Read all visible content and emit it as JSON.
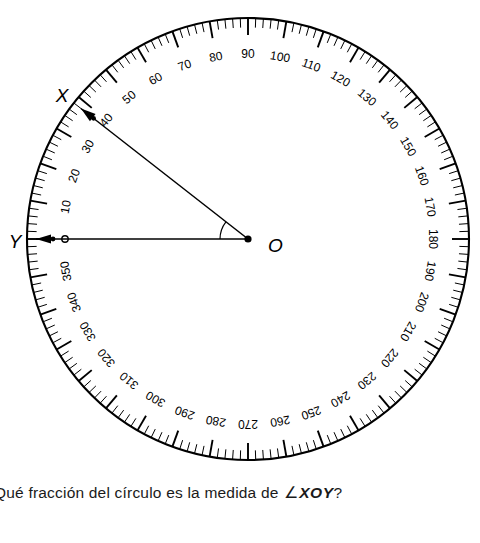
{
  "diagram": {
    "type": "full-circle-protractor",
    "center_label": "O",
    "point_labels": [
      "X",
      "Y"
    ],
    "geometry": {
      "center_x": 248,
      "center_y": 239,
      "radius": 221,
      "tick_step_degrees": 2,
      "label_step_degrees": 10,
      "zero_direction": "left",
      "direction": "clockwise",
      "ray_OY_degrees": 0,
      "ray_OX_degrees": 38,
      "angle_arc_radius": 28
    },
    "scale_labels": [
      "10",
      "20",
      "30",
      "40",
      "50",
      "60",
      "70",
      "80",
      "90",
      "100",
      "110",
      "120",
      "130",
      "140",
      "150",
      "160",
      "170",
      "180",
      "190",
      "200",
      "210",
      "220",
      "230",
      "240",
      "250",
      "260",
      "270",
      "280",
      "290",
      "300",
      "310",
      "320",
      "330",
      "340",
      "350"
    ],
    "colors": {
      "ink": "#000000",
      "background": "#ffffff",
      "text": "#1a1a1a"
    }
  },
  "question": {
    "prefix": "Qué fracción del círculo es la medida de ",
    "angle_symbol": "∠",
    "angle_name": "XOY",
    "suffix": "?",
    "full_text": "Qué fracción del círculo es la medida de ∠XOY?"
  }
}
